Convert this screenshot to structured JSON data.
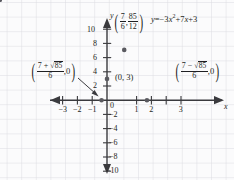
{
  "figure": {
    "part_label": "c.",
    "background_color": "#fbfbfc",
    "grid_color": "#dcdce1",
    "axis_color": "#3a3a3e",
    "curve_color": "#4a4a50",
    "point_color": "#5a5a60"
  },
  "chart_data": {
    "type": "line",
    "title": "",
    "equation_text": "y = -3x² + 7x + 3",
    "equation_parts": {
      "lhs": "y",
      "eq": "=",
      "term1_coeff": "−3",
      "term1_var": "x",
      "term1_exp": "2",
      "plus1": "+",
      "term2": "7",
      "term2_var": "x",
      "plus2": "+",
      "term3": "3"
    },
    "function": "y = -3x^2 + 7x + 3",
    "xlabel": "x",
    "ylabel": "y",
    "xlim": [
      -3.6,
      3.8
    ],
    "ylim": [
      -11.5,
      11.0
    ],
    "xticks": [
      -3,
      -2,
      -1,
      1,
      2,
      3
    ],
    "xtick_labels": [
      "−3",
      "−2",
      "−1",
      "1",
      "2",
      "3"
    ],
    "yticks": [
      -10,
      -8,
      -6,
      -4,
      -2,
      2,
      4,
      6,
      8,
      10
    ],
    "ytick_labels": [
      "−10",
      "−8",
      "−6",
      "−4",
      "−2",
      "2",
      "4",
      "6",
      "8",
      "10"
    ],
    "origin_label": "0",
    "grid": true,
    "grid_spacing_units": 0.5,
    "points": [
      {
        "name": "left-x-intercept",
        "x": -0.3697,
        "y": 0
      },
      {
        "name": "y-intercept",
        "x": 0,
        "y": 3
      },
      {
        "name": "vertex",
        "x": 1.1667,
        "y": 7.0833
      },
      {
        "name": "right-x-intercept",
        "x": 2.703,
        "y": 0
      }
    ],
    "annotations": [
      {
        "name": "vertex-label",
        "kind": "fraction-pair",
        "open_paren": "(",
        "first_num": "7",
        "first_den": "6",
        "comma": ",",
        "second_num": "85",
        "second_den": "12",
        "close_paren": ")",
        "value_x": "7/6",
        "value_y": "85/12"
      },
      {
        "name": "left-root-label",
        "kind": "radical-fraction",
        "open_paren": "(",
        "num_lead": "7",
        "num_op": "+",
        "num_radical": "√",
        "num_radicand": "85",
        "den": "6",
        "comma": ",",
        "zero": "0",
        "close_paren": ")",
        "value": "(7 + √85)/6"
      },
      {
        "name": "right-root-label",
        "kind": "radical-fraction",
        "open_paren": "(",
        "num_lead": "7",
        "num_op": "−",
        "num_radical": "√",
        "num_radicand": "85",
        "den": "6",
        "comma": ",",
        "zero": "0",
        "close_paren": ")",
        "value": "(7 − √85)/6"
      },
      {
        "name": "y-intercept-label",
        "kind": "ordered-pair",
        "text": "(0, 3)"
      }
    ]
  }
}
